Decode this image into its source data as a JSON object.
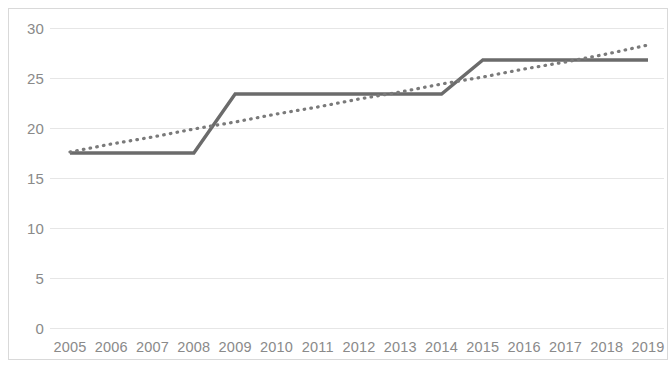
{
  "chart_data": {
    "type": "line",
    "title": "",
    "subtitle": "",
    "xlabel": "",
    "ylabel": "",
    "categories": [
      "2005",
      "2006",
      "2007",
      "2008",
      "2009",
      "2010",
      "2011",
      "2012",
      "2013",
      "2014",
      "2015",
      "2016",
      "2017",
      "2018",
      "2019"
    ],
    "series": [
      {
        "name": "data-series",
        "style": "solid",
        "color": "#6b6b6b",
        "values": [
          17.5,
          17.5,
          17.5,
          17.5,
          23.4,
          23.4,
          23.4,
          23.4,
          23.4,
          23.4,
          26.8,
          26.8,
          26.8,
          26.8,
          26.8
        ]
      },
      {
        "name": "trendline",
        "style": "dotted",
        "color": "#7a7a7a",
        "values": [
          17.6,
          18.4,
          19.1,
          19.9,
          20.6,
          21.4,
          22.1,
          22.9,
          23.6,
          24.4,
          25.1,
          25.9,
          26.6,
          27.4,
          28.3
        ]
      }
    ],
    "y_ticks": [
      0,
      5,
      10,
      15,
      20,
      25,
      30
    ],
    "y_tick_labels": [
      "0",
      "5",
      "10",
      "15",
      "20",
      "25",
      "30"
    ],
    "ylim": [
      0,
      30
    ],
    "grid": true,
    "grid_color": "#e6e6e6",
    "legend": "none",
    "axis_label_color": "#8a8a8a",
    "background_color": "#ffffff",
    "border_color": "#d9d9d9"
  }
}
